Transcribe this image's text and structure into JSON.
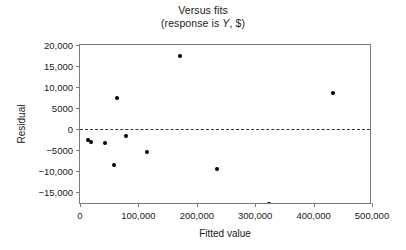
{
  "chart_data": {
    "type": "scatter",
    "title": "Versus fits",
    "subtitle_prefix": "(response is ",
    "subtitle_italic": "Y",
    "subtitle_suffix": ", $)",
    "xlabel": "Fitted value",
    "ylabel": "Residual",
    "xlim": [
      0,
      500000
    ],
    "ylim": [
      -18000,
      20000
    ],
    "grid": false,
    "legend": "none",
    "zero_reference_line": 0,
    "xticks": [
      0,
      100000,
      200000,
      300000,
      400000,
      500000
    ],
    "xticklabels": [
      "0",
      "100,000",
      "200,000",
      "300,000",
      "400,000",
      "500,000"
    ],
    "yticks": [
      20000,
      15000,
      10000,
      5000,
      0,
      -5000,
      -10000,
      -15000
    ],
    "yticklabels": [
      "20,000",
      "15,000",
      "10,000",
      "5000",
      "0",
      "−5000",
      "−10,000",
      "−15,000"
    ],
    "marker": "filled-circle",
    "marker_color": "#000000",
    "points": [
      {
        "x": 14000,
        "y": -2500
      },
      {
        "x": 18000,
        "y": -3000
      },
      {
        "x": 43000,
        "y": -3250
      },
      {
        "x": 58000,
        "y": -8500
      },
      {
        "x": 63000,
        "y": 7500
      },
      {
        "x": 79000,
        "y": -1500
      },
      {
        "x": 115000,
        "y": -5500
      },
      {
        "x": 172000,
        "y": 17500
      },
      {
        "x": 234000,
        "y": -9500
      },
      {
        "x": 323000,
        "y": -17750
      },
      {
        "x": 434000,
        "y": 8500
      }
    ]
  }
}
